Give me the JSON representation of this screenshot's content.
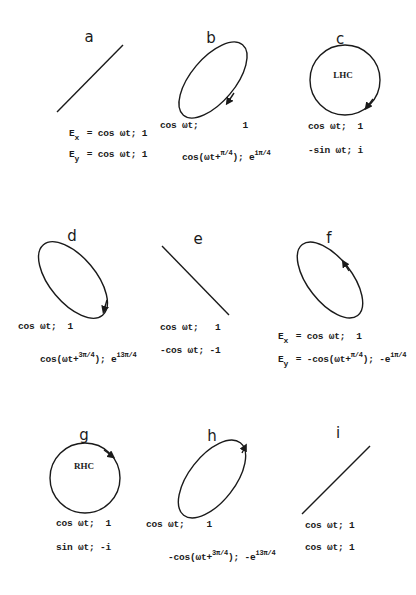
{
  "figure": {
    "line_color": "#1a1a1a",
    "background": "#ffffff"
  },
  "panels": [
    {
      "id": "a",
      "label": "a",
      "shape": "line",
      "orientation": "positive-slope",
      "ex_prefix": "E",
      "ex_sub": "x",
      "ex_text": " = cos ωt; 1",
      "ey_prefix": "E",
      "ey_sub": "y",
      "ey_text": " = cos ωt; 1"
    },
    {
      "id": "b",
      "label": "b",
      "shape": "ellipse",
      "orientation": "positive-slope",
      "arrow": "clockwise",
      "ex_text": "cos ωt;        1",
      "ey_text": "cos(ωt+",
      "ey_frac": "π/4",
      "ey_tail": "); e",
      "ey_exp": "iπ/4"
    },
    {
      "id": "c",
      "label": "c",
      "shape": "circle",
      "center_label": "LHC",
      "arrow": "clockwise",
      "ex_text": "cos ωt;  1",
      "ey_text": "-sin ωt; i"
    },
    {
      "id": "d",
      "label": "d",
      "shape": "ellipse",
      "orientation": "negative-slope",
      "arrow": "clockwise",
      "ex_text": "cos ωt;  1",
      "ey_text": "cos(ωt+",
      "ey_frac": "3π/4",
      "ey_tail": "); e",
      "ey_exp": "i3π/4"
    },
    {
      "id": "e",
      "label": "e",
      "shape": "line",
      "orientation": "negative-slope",
      "ex_text": "cos ωt;   1",
      "ey_text": "-cos ωt; -1"
    },
    {
      "id": "f",
      "label": "f",
      "shape": "ellipse",
      "orientation": "negative-slope",
      "arrow": "counterclockwise",
      "ex_prefix": "E",
      "ex_sub": "x",
      "ex_text": " = cos ωt;  1",
      "ey_prefix": "E",
      "ey_sub": "y",
      "ey_text": " = -cos(ωt+",
      "ey_frac": "π/4",
      "ey_tail": "); -e",
      "ey_exp": "iπ/4"
    },
    {
      "id": "g",
      "label": "g",
      "shape": "circle",
      "center_label": "RHC",
      "arrow": "counterclockwise",
      "ex_text": "cos ωt;  1",
      "ey_text": "sin ωt; -i"
    },
    {
      "id": "h",
      "label": "h",
      "shape": "ellipse",
      "orientation": "positive-slope",
      "arrow": "counterclockwise",
      "ex_text": "cos ωt;    1",
      "ey_text": "-cos(ωt+",
      "ey_frac": "3π/4",
      "ey_tail": "); -e",
      "ey_exp": "i3π/4"
    },
    {
      "id": "i",
      "label": "i",
      "shape": "line",
      "orientation": "positive-slope",
      "ex_text": "cos ωt; 1",
      "ey_text": "cos ωt; 1"
    }
  ]
}
